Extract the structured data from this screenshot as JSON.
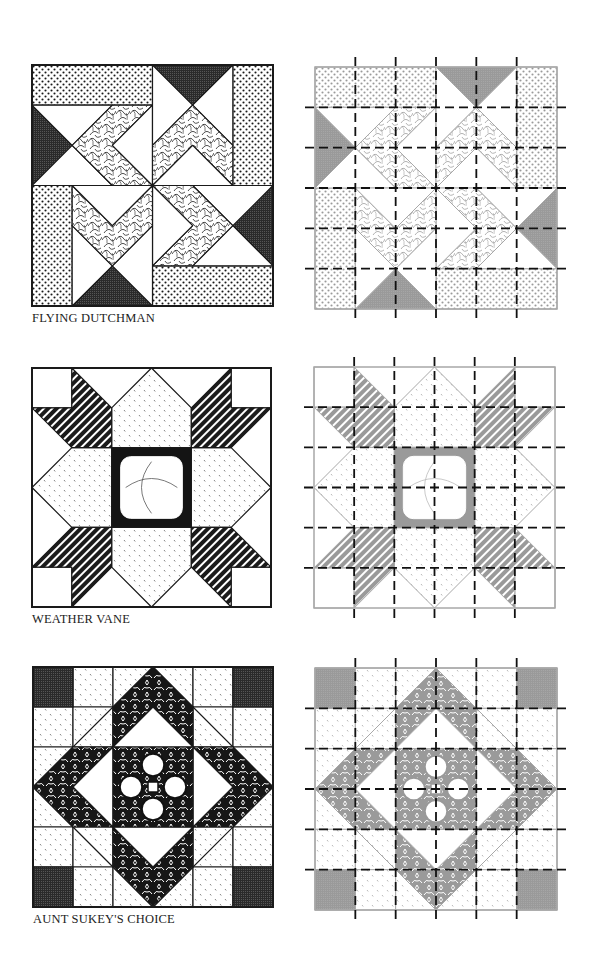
{
  "page": {
    "background": "#ffffff"
  },
  "colors": {
    "ink": "#1a1a1a",
    "dark_fabric": "#2a2a2a",
    "gray_fabric": "#9a9a9a",
    "gray_outline": "#a8a8a8",
    "dashed_line": "#111111"
  },
  "blocks": [
    {
      "id": "flying-dutchman",
      "caption": "FLYING DUTCHMAN",
      "grid": 6,
      "original": {
        "x": 32,
        "y": 65,
        "size": 241
      },
      "diagram": {
        "x": 315,
        "y": 67,
        "size": 242,
        "cuts": 5
      },
      "caption_pos": {
        "x": 32,
        "y": 311
      }
    },
    {
      "id": "weather-vane",
      "caption": "WEATHER VANE",
      "grid": 6,
      "original": {
        "x": 32,
        "y": 368,
        "size": 239
      },
      "diagram": {
        "x": 314,
        "y": 367,
        "size": 241,
        "cuts": 5
      },
      "caption_pos": {
        "x": 32,
        "y": 612
      }
    },
    {
      "id": "aunt-sukeys-choice",
      "caption": "AUNT SUKEY'S CHOICE",
      "grid": 6,
      "original": {
        "x": 33,
        "y": 667,
        "size": 240
      },
      "diagram": {
        "x": 315,
        "y": 668,
        "size": 242,
        "cuts": 5
      },
      "caption_pos": {
        "x": 33,
        "y": 912
      }
    }
  ]
}
